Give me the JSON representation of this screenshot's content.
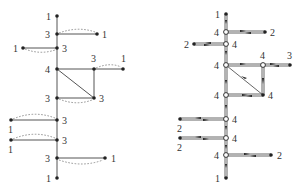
{
  "figure": {
    "left_graph": {
      "description": "Undirected graph with vertex degree labels and dashed arcs",
      "vertices": [
        {
          "id": "a",
          "label": "1",
          "x": 57,
          "y": 16,
          "lx": 46,
          "ly": 20
        },
        {
          "id": "b",
          "label": "3",
          "x": 57,
          "y": 34,
          "lx": 45,
          "ly": 38
        },
        {
          "id": "b1",
          "label": "1",
          "x": 97,
          "y": 34,
          "lx": 102,
          "ly": 38
        },
        {
          "id": "c",
          "label": "3",
          "x": 57,
          "y": 48,
          "lx": 62,
          "ly": 52
        },
        {
          "id": "c1",
          "label": "1",
          "x": 23,
          "y": 48,
          "lx": 13,
          "ly": 52
        },
        {
          "id": "d",
          "label": "4",
          "x": 57,
          "y": 69,
          "lx": 45,
          "ly": 73
        },
        {
          "id": "e",
          "label": "3",
          "x": 94,
          "y": 69,
          "lx": 91,
          "ly": 62
        },
        {
          "id": "e1",
          "label": "1",
          "x": 123,
          "y": 69,
          "lx": 121,
          "ly": 62
        },
        {
          "id": "f",
          "label": "3",
          "x": 57,
          "y": 98,
          "lx": 45,
          "ly": 102
        },
        {
          "id": "g",
          "label": "3",
          "x": 94,
          "y": 98,
          "lx": 99,
          "ly": 102
        },
        {
          "id": "h",
          "label": "3",
          "x": 57,
          "y": 120,
          "lx": 62,
          "ly": 124
        },
        {
          "id": "h1",
          "label": "1",
          "x": 11,
          "y": 120,
          "lx": 8,
          "ly": 133
        },
        {
          "id": "i",
          "label": "3",
          "x": 57,
          "y": 140,
          "lx": 62,
          "ly": 144
        },
        {
          "id": "i1",
          "label": "1",
          "x": 11,
          "y": 140,
          "lx": 8,
          "ly": 153
        },
        {
          "id": "j",
          "label": "3",
          "x": 57,
          "y": 158,
          "lx": 45,
          "ly": 162
        },
        {
          "id": "j1",
          "label": "1",
          "x": 105,
          "y": 158,
          "lx": 111,
          "ly": 162
        },
        {
          "id": "k",
          "label": "1",
          "x": 57,
          "y": 178,
          "lx": 46,
          "ly": 182
        }
      ]
    },
    "right_graph": {
      "description": "Directed double-edge traversal with arrows and degree labels",
      "vertices": [
        {
          "label": "1",
          "x": 226,
          "y": 14,
          "lx": 215,
          "ly": 18
        },
        {
          "label": "4",
          "x": 226,
          "y": 32,
          "lx": 214,
          "ly": 36
        },
        {
          "label": "2",
          "x": 265,
          "y": 32,
          "lx": 270,
          "ly": 36
        },
        {
          "label": "4",
          "x": 226,
          "y": 44,
          "lx": 232,
          "ly": 48
        },
        {
          "label": "2",
          "x": 194,
          "y": 44,
          "lx": 184,
          "ly": 48
        },
        {
          "label": "4",
          "x": 226,
          "y": 65,
          "lx": 214,
          "ly": 69
        },
        {
          "label": "4",
          "x": 263,
          "y": 65,
          "lx": 260,
          "ly": 59
        },
        {
          "label": "3",
          "x": 290,
          "y": 65,
          "lx": 287,
          "ly": 59
        },
        {
          "label": "4",
          "x": 226,
          "y": 95,
          "lx": 214,
          "ly": 99
        },
        {
          "label": "4",
          "x": 263,
          "y": 95,
          "lx": 268,
          "ly": 99
        },
        {
          "label": "4",
          "x": 226,
          "y": 119,
          "lx": 232,
          "ly": 123
        },
        {
          "label": "2",
          "x": 180,
          "y": 119,
          "lx": 177,
          "ly": 132
        },
        {
          "label": "4",
          "x": 226,
          "y": 138,
          "lx": 232,
          "ly": 142
        },
        {
          "label": "2",
          "x": 180,
          "y": 138,
          "lx": 177,
          "ly": 151
        },
        {
          "label": "4",
          "x": 226,
          "y": 155,
          "lx": 214,
          "ly": 159
        },
        {
          "label": "2",
          "x": 271,
          "y": 155,
          "lx": 277,
          "ly": 159
        },
        {
          "label": "1",
          "x": 226,
          "y": 178,
          "lx": 215,
          "ly": 182
        }
      ]
    }
  }
}
